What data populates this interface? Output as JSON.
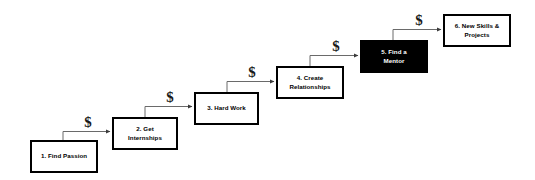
{
  "diagram": {
    "type": "staircase-flow",
    "background_color": "#ffffff",
    "line_color": "#555555",
    "box_border_color": "#000000",
    "highlight_box_fill": "#000000",
    "highlight_box_text_color": "#ffffff",
    "steps": [
      {
        "id": "step-1",
        "number": "1.",
        "label": "1. Find Passion",
        "lines": [
          "1. Find Passion"
        ],
        "highlighted": false,
        "x": 30,
        "y": 140,
        "w": 68,
        "h": 33
      },
      {
        "id": "step-2",
        "number": "2.",
        "label": "2. Get Internships",
        "lines": [
          "2. Get",
          "Internships"
        ],
        "highlighted": false,
        "x": 112,
        "y": 117,
        "w": 66,
        "h": 33
      },
      {
        "id": "step-3",
        "number": "3.",
        "label": "3. Hard Work",
        "lines": [
          "3. Hard Work"
        ],
        "highlighted": false,
        "x": 194,
        "y": 92,
        "w": 65,
        "h": 33
      },
      {
        "id": "step-4",
        "number": "4.",
        "label": "4. Create Relationships",
        "lines": [
          "4. Create",
          "Relationships"
        ],
        "highlighted": false,
        "x": 276,
        "y": 66,
        "w": 68,
        "h": 33
      },
      {
        "id": "step-5",
        "number": "5.",
        "label": "5. Find a Mentor",
        "lines": [
          "5. Find a",
          "Mentor"
        ],
        "highlighted": true,
        "x": 360,
        "y": 40,
        "w": 68,
        "h": 33
      },
      {
        "id": "step-6",
        "number": "6.",
        "label": "6. New Skills & Projects",
        "lines": [
          "6. New Skills &",
          "Projects"
        ],
        "highlighted": false,
        "x": 443,
        "y": 14,
        "w": 68,
        "h": 33
      }
    ],
    "connectors": [
      {
        "id": "conn-1-2",
        "from": "step-1",
        "to": "step-2",
        "cost_marker": "$",
        "marker_x": 88,
        "marker_y": 129
      },
      {
        "id": "conn-2-3",
        "from": "step-2",
        "to": "step-3",
        "cost_marker": "$",
        "marker_x": 170,
        "marker_y": 104
      },
      {
        "id": "conn-3-4",
        "from": "step-3",
        "to": "step-4",
        "cost_marker": "$",
        "marker_x": 252,
        "marker_y": 79
      },
      {
        "id": "conn-4-5",
        "from": "step-4",
        "to": "step-5",
        "cost_marker": "$",
        "marker_x": 336,
        "marker_y": 53
      },
      {
        "id": "conn-5-6",
        "from": "step-5",
        "to": "step-6",
        "cost_marker": "$",
        "marker_x": 419,
        "marker_y": 27
      }
    ]
  }
}
